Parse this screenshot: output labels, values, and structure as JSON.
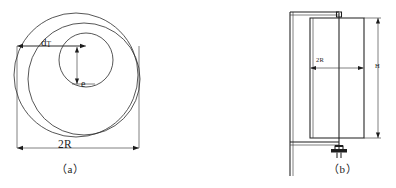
{
  "figure": {
    "title": "",
    "background_color": "#ffffff",
    "line_color": "#2b2b2b",
    "width": 396,
    "height": 188
  },
  "panel_a": {
    "caption": "（a）",
    "labels": {
      "diameter_t_main": "d",
      "diameter_t_sub": "T",
      "eccentricity": "e",
      "outer_width": "2R"
    },
    "geometry_note": "two eccentric intersecting circles inscribed in a square dimension frame"
  },
  "panel_b": {
    "caption": "（b）",
    "labels": {
      "width": "2R",
      "height": "H"
    },
    "geometry_note": "side elevation of cylindrical body on a frame with bottom valve fitting"
  }
}
